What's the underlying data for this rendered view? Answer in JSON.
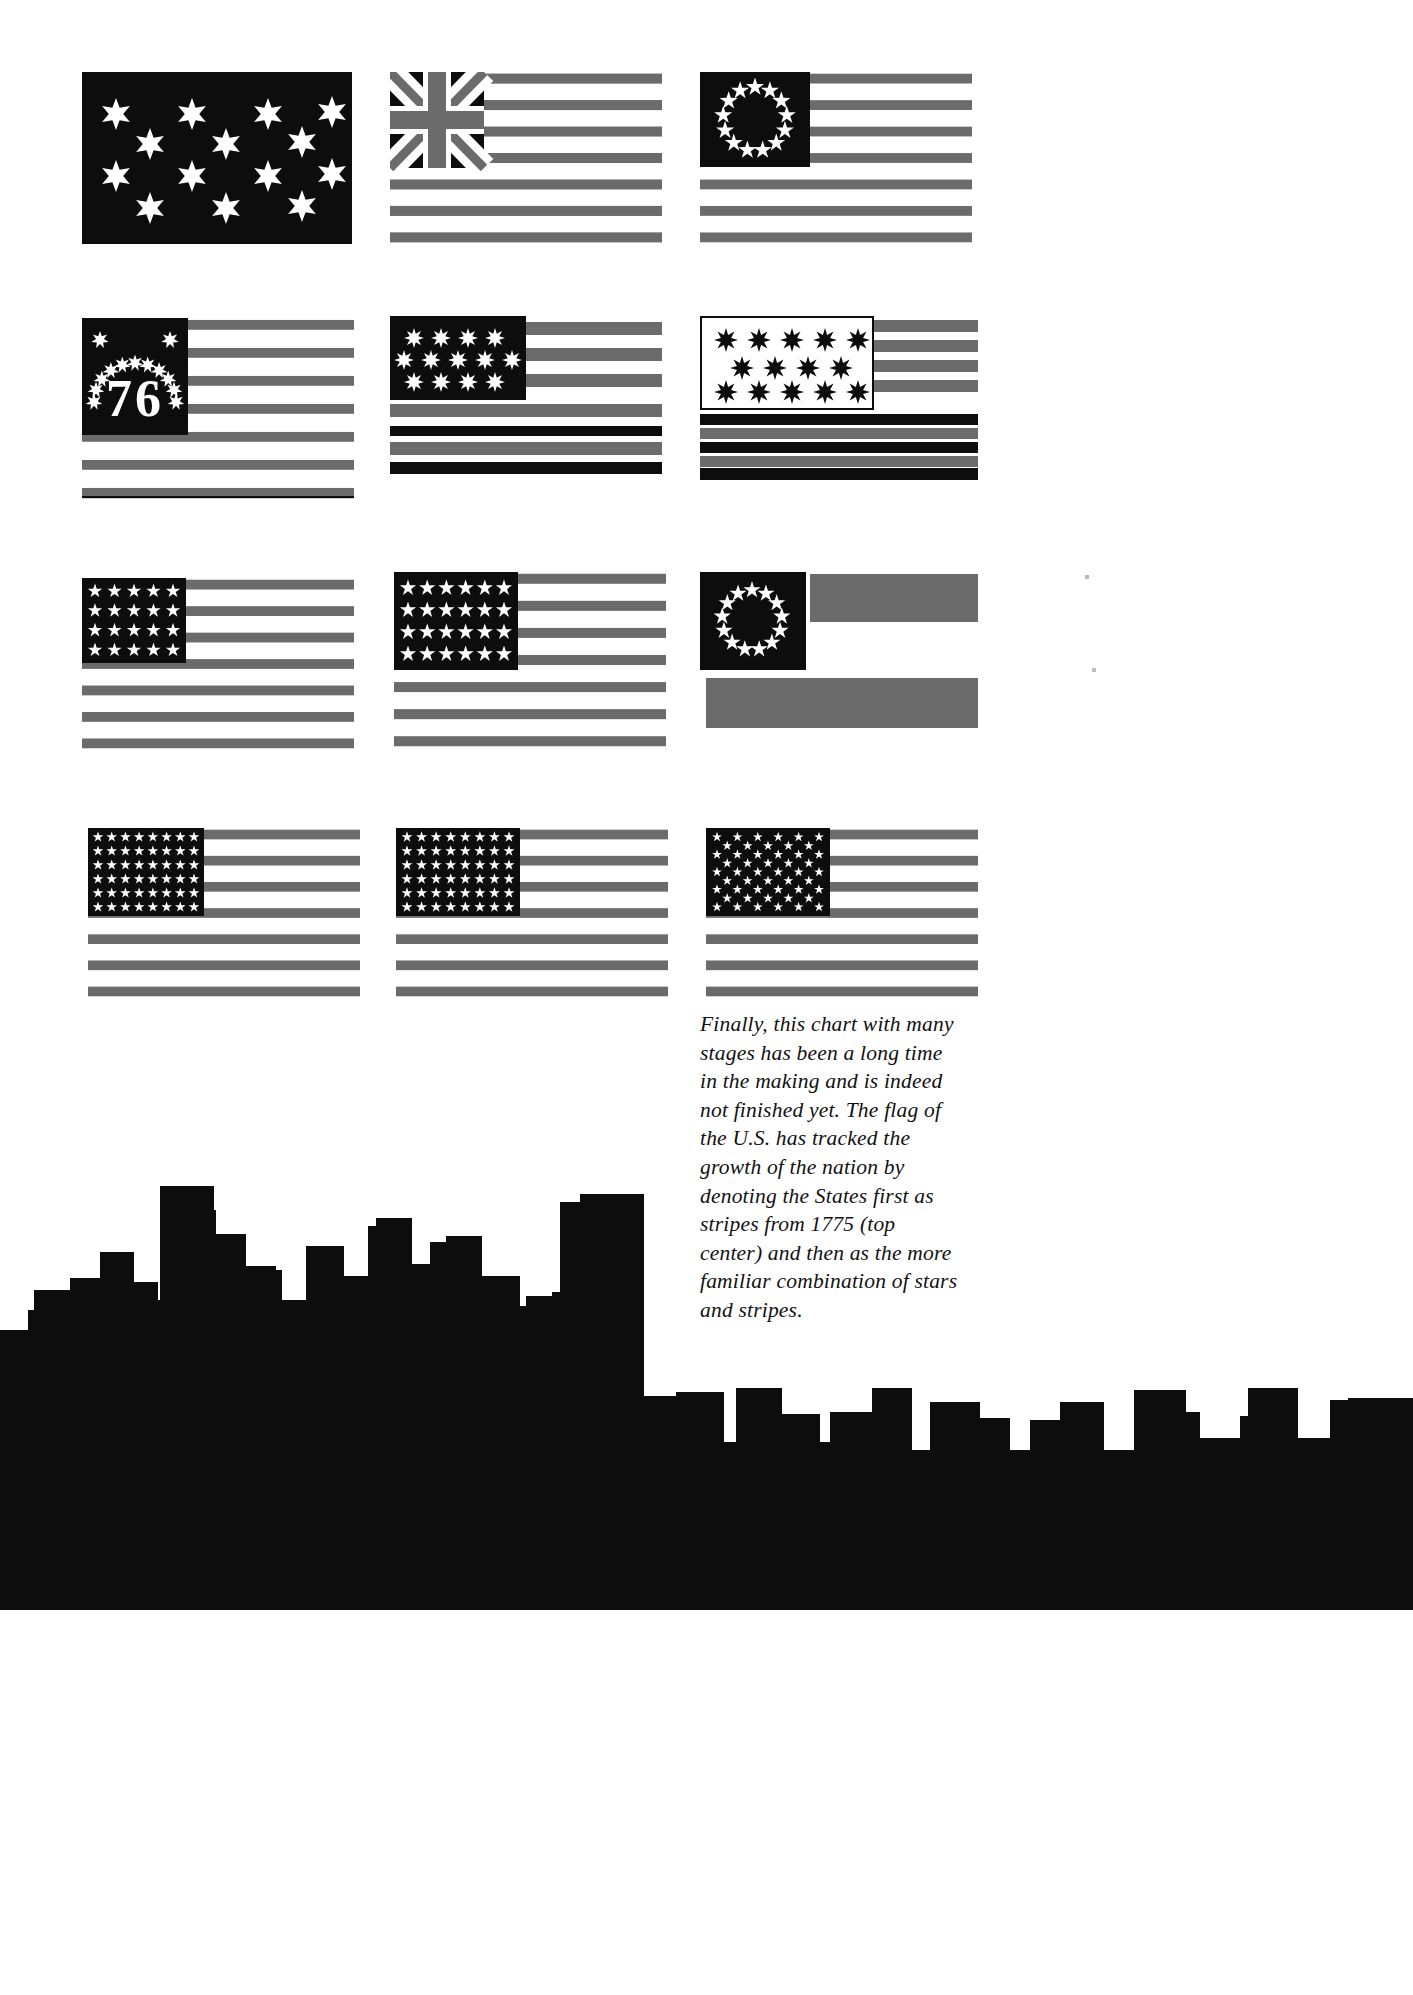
{
  "page": {
    "background_color": "#ffffff",
    "ink_black": "#0d0d0d",
    "ink_gray": "#6b6b6b",
    "width": 1413,
    "height": 1995
  },
  "caption": {
    "text": "Finally, this chart with many stages has been a long time in the making and is indeed not finished yet. The flag of the U.S. has tracked the growth of the nation by denoting the States first as stripes from 1775 (top center) and then as the more familiar combination of stars and stripes.",
    "style": "italic-serif",
    "lines": [
      "Finally, this chart with many",
      "stages has been a long time in",
      "the making and is indeed not",
      "finished yet. The flag of the",
      "U.S. has tracked the growth of",
      "the nation by denoting the",
      "States first as stripes from 1775",
      "(top center) and then as the",
      "more familiar combination of",
      "stars and stripes."
    ]
  },
  "chart_data": {
    "type": "diagram",
    "rows": 4,
    "columns": 3,
    "flags": [
      {
        "id": "flag-1",
        "name": "continental-colors-no-stripes",
        "row": 1,
        "col": 1,
        "x": 82,
        "y": 72,
        "w": 270,
        "h": 172,
        "field": "solid-black",
        "canton": null,
        "stars": {
          "count": 13,
          "points": 6,
          "color": "#ffffff",
          "layout": "scattered-3-4-3-3"
        },
        "stripes": {
          "count": 0,
          "colors": []
        }
      },
      {
        "id": "flag-2",
        "name": "grand-union-flag",
        "row": 1,
        "col": 2,
        "x": 390,
        "y": 72,
        "w": 270,
        "h": 172,
        "canton": {
          "type": "union-jack",
          "w": 92,
          "h": 94,
          "colors": [
            "#0d0d0d",
            "#6b6b6b",
            "#ffffff"
          ]
        },
        "stars": {
          "count": 0,
          "points": 0
        },
        "stripes": {
          "count": 13,
          "colors": [
            "#6b6b6b",
            "#ffffff"
          ]
        }
      },
      {
        "id": "flag-3",
        "name": "betsy-ross-13-star-circle",
        "row": 1,
        "col": 3,
        "x": 700,
        "y": 72,
        "w": 270,
        "h": 172,
        "canton": {
          "type": "black",
          "w": 110,
          "h": 94
        },
        "stars": {
          "count": 13,
          "points": 5,
          "color": "#ffffff",
          "layout": "circle"
        },
        "stripes": {
          "count": 13,
          "colors": [
            "#6b6b6b",
            "#ffffff"
          ]
        }
      },
      {
        "id": "flag-4",
        "name": "bennington-76-flag",
        "row": 2,
        "col": 1,
        "x": 82,
        "y": 318,
        "w": 270,
        "h": 178,
        "canton": {
          "type": "black",
          "w": 106,
          "h": 116
        },
        "stars": {
          "count": 13,
          "points": 7,
          "color": "#ffffff",
          "layout": "arch"
        },
        "numeral": "76",
        "stripes": {
          "count": 13,
          "colors": [
            "#6b6b6b",
            "#ffffff"
          ]
        }
      },
      {
        "id": "flag-5",
        "name": "thirteen-star-8point-flag",
        "row": 2,
        "col": 2,
        "x": 390,
        "y": 318,
        "w": 270,
        "h": 160,
        "canton": {
          "type": "black",
          "w": 136,
          "h": 82
        },
        "stars": {
          "count": 13,
          "points": 8,
          "color": "#ffffff",
          "layout": "rows-4-5-4"
        },
        "stripes": {
          "count": 9,
          "colors": [
            "#6b6b6b",
            "#0d0d0d",
            "#ffffff"
          ]
        }
      },
      {
        "id": "flag-6",
        "name": "white-canton-black-stars-flag",
        "row": 2,
        "col": 3,
        "x": 700,
        "y": 318,
        "w": 276,
        "h": 162,
        "canton": {
          "type": "white-outlined",
          "w": 174,
          "h": 94
        },
        "stars": {
          "count": 14,
          "points": 8,
          "color": "#0d0d0d",
          "layout": "rows-5-4-5"
        },
        "stripes": {
          "count": 11,
          "colors": [
            "#6b6b6b",
            "#0d0d0d",
            "#ffffff"
          ]
        }
      },
      {
        "id": "flag-7",
        "name": "twenty-star-flag",
        "row": 3,
        "col": 1,
        "x": 82,
        "y": 578,
        "w": 270,
        "h": 170,
        "canton": {
          "type": "black",
          "w": 104,
          "h": 84
        },
        "stars": {
          "count": 20,
          "points": 5,
          "color": "#ffffff",
          "layout": "rows-5x4"
        },
        "stripes": {
          "count": 13,
          "colors": [
            "#6b6b6b",
            "#ffffff"
          ]
        }
      },
      {
        "id": "flag-8",
        "name": "twenty-four-star-flag",
        "row": 3,
        "col": 2,
        "x": 394,
        "y": 572,
        "w": 270,
        "h": 172,
        "canton": {
          "type": "black",
          "w": 124,
          "h": 96
        },
        "stars": {
          "count": 24,
          "points": 5,
          "color": "#ffffff",
          "layout": "rows-6x4"
        },
        "stripes": {
          "count": 13,
          "colors": [
            "#6b6b6b",
            "#ffffff"
          ]
        }
      },
      {
        "id": "flag-9",
        "name": "thirteen-star-circle-wide-stripes-flag",
        "row": 3,
        "col": 3,
        "x": 700,
        "y": 572,
        "w": 276,
        "h": 158,
        "canton": {
          "type": "black",
          "w": 106,
          "h": 96
        },
        "stars": {
          "count": 13,
          "points": 5,
          "color": "#ffffff",
          "layout": "circle"
        },
        "stripes": {
          "count": 3,
          "colors": [
            "#6b6b6b",
            "#ffffff"
          ]
        }
      },
      {
        "id": "flag-10",
        "name": "thirty-eight-star-flag",
        "row": 4,
        "col": 1,
        "x": 88,
        "y": 828,
        "w": 270,
        "h": 168,
        "canton": {
          "type": "black",
          "w": 116,
          "h": 86
        },
        "stars": {
          "count": 40,
          "points": 5,
          "color": "#ffffff",
          "layout": "rows-8x5"
        },
        "stripes": {
          "count": 13,
          "colors": [
            "#6b6b6b",
            "#ffffff"
          ]
        }
      },
      {
        "id": "flag-11",
        "name": "forty-eight-star-flag",
        "row": 4,
        "col": 2,
        "x": 396,
        "y": 828,
        "w": 270,
        "h": 168,
        "canton": {
          "type": "black",
          "w": 124,
          "h": 86
        },
        "stars": {
          "count": 48,
          "points": 5,
          "color": "#ffffff",
          "layout": "rows-8x6"
        },
        "stripes": {
          "count": 13,
          "colors": [
            "#6b6b6b",
            "#ffffff"
          ]
        }
      },
      {
        "id": "flag-12",
        "name": "fifty-star-flag",
        "row": 4,
        "col": 3,
        "x": 706,
        "y": 828,
        "w": 270,
        "h": 168,
        "canton": {
          "type": "black",
          "w": 124,
          "h": 86
        },
        "stars": {
          "count": 50,
          "points": 5,
          "color": "#ffffff",
          "layout": "rows-6-5-alternating"
        },
        "stripes": {
          "count": 13,
          "colors": [
            "#6b6b6b",
            "#ffffff"
          ]
        }
      }
    ]
  },
  "skyline": {
    "name": "city-skyline-silhouette",
    "color": "#0d0d0d",
    "description": "Black silhouette of a city skyline spanning the lower portion of the page"
  }
}
